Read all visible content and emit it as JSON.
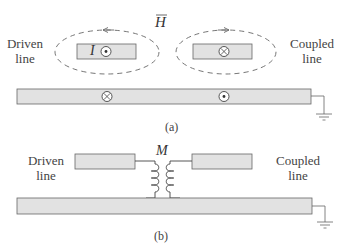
{
  "figure_a": {
    "driven_label_1": "Driven",
    "driven_label_2": "line",
    "coupled_label_1": "Coupled",
    "coupled_label_2": "line",
    "field_symbol": "H",
    "current_symbol": "I",
    "caption": "(a)"
  },
  "figure_b": {
    "driven_label_1": "Driven",
    "driven_label_2": "line",
    "coupled_label_1": "Coupled",
    "coupled_label_2": "line",
    "mutual_inductance_symbol": "M",
    "caption": "(b)"
  },
  "colors": {
    "conductor_fill": "#e2e2e2",
    "stroke": "#555555",
    "dash": "#666666"
  }
}
